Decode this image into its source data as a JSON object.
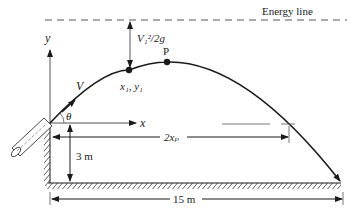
{
  "diagram": {
    "labels": {
      "energy_line": "Energy line",
      "velocity_head": "V₁²/2g",
      "peak_point": "P",
      "point_1": "x₁, y₁",
      "velocity": "V",
      "angle": "θ",
      "x_axis": "x",
      "y_axis": "y",
      "height": "3 m",
      "twice_xp": "2xₚ",
      "range": "15 m"
    },
    "colors": {
      "stroke": "#1a1a1a",
      "dashed": "#555555",
      "text": "#222222"
    }
  }
}
